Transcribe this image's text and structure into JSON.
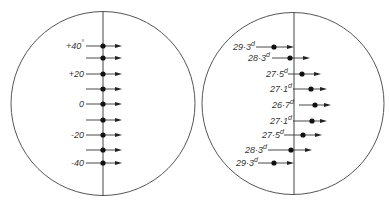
{
  "left_panel": {
    "circle": {
      "cx": 103,
      "cy": 103.5,
      "r": 92
    },
    "vertical_x": 103,
    "unit_symbol": "°",
    "rows": [
      {
        "y": 46,
        "label": "+40",
        "sup": "°",
        "line_start": 86,
        "dot_x": 103,
        "arrow_end": 122
      },
      {
        "y": 58,
        "label": "",
        "sup": "",
        "line_start": 86,
        "dot_x": 103,
        "arrow_end": 122
      },
      {
        "y": 74,
        "label": "+20",
        "sup": "",
        "line_start": 86,
        "dot_x": 103,
        "arrow_end": 122
      },
      {
        "y": 89,
        "label": "",
        "sup": "",
        "line_start": 86,
        "dot_x": 103,
        "arrow_end": 122
      },
      {
        "y": 104,
        "label": "0",
        "sup": "",
        "line_start": 86,
        "dot_x": 103,
        "arrow_end": 122
      },
      {
        "y": 120,
        "label": "",
        "sup": "",
        "line_start": 86,
        "dot_x": 103,
        "arrow_end": 122
      },
      {
        "y": 135,
        "label": "-20",
        "sup": "",
        "line_start": 86,
        "dot_x": 103,
        "arrow_end": 122
      },
      {
        "y": 150,
        "label": "",
        "sup": "",
        "line_start": 86,
        "dot_x": 103,
        "arrow_end": 122
      },
      {
        "y": 163,
        "label": "-40",
        "sup": "",
        "line_start": 86,
        "dot_x": 103,
        "arrow_end": 122
      }
    ]
  },
  "right_panel": {
    "circle": {
      "cx": 293,
      "cy": 103.5,
      "r": 91
    },
    "vertical_x": 294,
    "unit_symbol": "d",
    "rows": [
      {
        "y": 47,
        "label": "29·3",
        "sup": "d",
        "label_x": 233,
        "line_start": 256,
        "dot_x": 274,
        "arrow_end": 294
      },
      {
        "y": 58,
        "label": "28·3",
        "sup": "d",
        "label_x": 248,
        "line_start": 272,
        "dot_x": 290,
        "arrow_end": 310
      },
      {
        "y": 74,
        "label": "27·5",
        "sup": "d",
        "label_x": 266,
        "line_start": 288,
        "dot_x": 302,
        "arrow_end": 321
      },
      {
        "y": 89,
        "label": "27·1",
        "sup": "d",
        "label_x": 270,
        "line_start": 293,
        "dot_x": 311,
        "arrow_end": 327
      },
      {
        "y": 105,
        "label": "26·7",
        "sup": "d",
        "label_x": 272,
        "line_start": 299,
        "dot_x": 315,
        "arrow_end": 331
      },
      {
        "y": 121,
        "label": "27·1",
        "sup": "d",
        "label_x": 270,
        "line_start": 293,
        "dot_x": 312,
        "arrow_end": 327
      },
      {
        "y": 135,
        "label": "27·5",
        "sup": "d",
        "label_x": 262,
        "line_start": 284,
        "dot_x": 303,
        "arrow_end": 322
      },
      {
        "y": 150,
        "label": "28·3",
        "sup": "d",
        "label_x": 245,
        "line_start": 268,
        "dot_x": 291,
        "arrow_end": 312
      },
      {
        "y": 163,
        "label": "29·3",
        "sup": "d",
        "label_x": 236,
        "line_start": 258,
        "dot_x": 274,
        "arrow_end": 294
      }
    ]
  }
}
